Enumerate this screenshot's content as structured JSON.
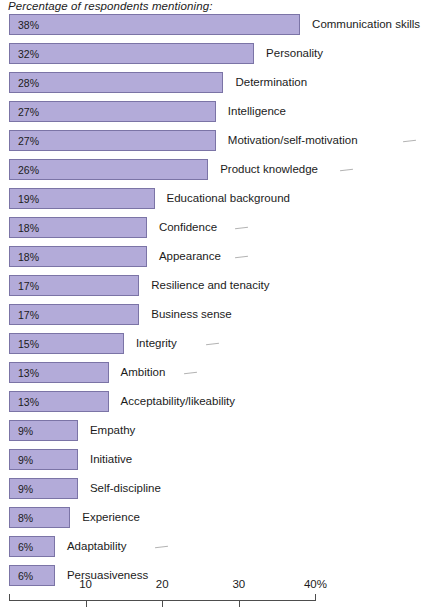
{
  "chart_data": {
    "type": "bar",
    "orientation": "horizontal",
    "title": "Percentage of respondents mentioning:",
    "xlabel": "",
    "ylabel": "",
    "xlim": [
      0,
      40
    ],
    "grid": false,
    "legend": null,
    "axis": {
      "ticks": [
        10,
        20,
        30,
        40
      ],
      "tick_labels": [
        "10",
        "20",
        "30",
        "40%"
      ],
      "unit_suffix": "%"
    },
    "categories": [
      "Communication skills",
      "Personality",
      "Determination",
      "Intelligence",
      "Motivation/self-motivation",
      "Product knowledge",
      "Educational background",
      "Confidence",
      "Appearance",
      "Resilience and tenacity",
      "Business sense",
      "Integrity",
      "Ambition",
      "Acceptability/likeability",
      "Empathy",
      "Initiative",
      "Self-discipline",
      "Experience",
      "Adaptability",
      "Persuasiveness"
    ],
    "values": [
      38,
      32,
      28,
      27,
      27,
      26,
      19,
      18,
      18,
      17,
      17,
      15,
      13,
      13,
      9,
      9,
      9,
      8,
      6,
      6
    ],
    "value_labels": [
      "38%",
      "32%",
      "28%",
      "27%",
      "27%",
      "26%",
      "19%",
      "18%",
      "18%",
      "17%",
      "17%",
      "15%",
      "13%",
      "13%",
      "9%",
      "9%",
      "9%",
      "8%",
      "6%",
      "6%"
    ],
    "annotated_rows": [
      0,
      4,
      5,
      7,
      8,
      11,
      12,
      18
    ]
  },
  "style": {
    "bar_fill": "#b3abd9",
    "bar_border": "#7b74a6",
    "text_color": "#1b1b1b",
    "axis_color": "#4d4d4d",
    "background": "#ffffff"
  }
}
